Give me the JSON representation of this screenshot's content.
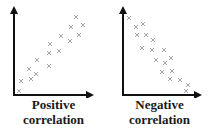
{
  "panels": [
    {
      "id": "positive",
      "label_line1": "Positive",
      "label_line2": "correlation",
      "axis_color": "#111111",
      "marker": "x-mark-icon",
      "marker_color": "#9a9a9a"
    },
    {
      "id": "negative",
      "label_line1": "Negative",
      "label_line2": "correlation",
      "axis_color": "#111111",
      "marker": "x-mark-icon",
      "marker_color": "#9a9a9a"
    }
  ],
  "chart_data": [
    {
      "type": "scatter",
      "title": "Positive correlation",
      "xlabel": "",
      "ylabel": "",
      "grid": false,
      "ticks": false,
      "marker": "x",
      "points": [
        [
          19,
          91
        ],
        [
          21,
          81
        ],
        [
          31,
          79
        ],
        [
          29,
          69
        ],
        [
          36,
          74
        ],
        [
          37,
          60
        ],
        [
          49,
          66
        ],
        [
          49,
          53
        ],
        [
          50,
          44
        ],
        [
          59,
          51
        ],
        [
          61,
          36
        ],
        [
          70,
          41
        ],
        [
          71,
          27
        ],
        [
          76,
          17
        ],
        [
          79,
          35
        ],
        [
          83,
          25
        ]
      ]
    },
    {
      "type": "scatter",
      "title": "Negative correlation",
      "xlabel": "",
      "ylabel": "",
      "grid": false,
      "ticks": false,
      "marker": "x",
      "points": [
        [
          129,
          18
        ],
        [
          136,
          27
        ],
        [
          143,
          24
        ],
        [
          137,
          35
        ],
        [
          146,
          35
        ],
        [
          153,
          40
        ],
        [
          142,
          48
        ],
        [
          152,
          50
        ],
        [
          164,
          50
        ],
        [
          156,
          60
        ],
        [
          165,
          63
        ],
        [
          171,
          58
        ],
        [
          162,
          72
        ],
        [
          172,
          71
        ],
        [
          170,
          79
        ],
        [
          180,
          80
        ],
        [
          188,
          85
        ],
        [
          186,
          91
        ]
      ]
    }
  ]
}
